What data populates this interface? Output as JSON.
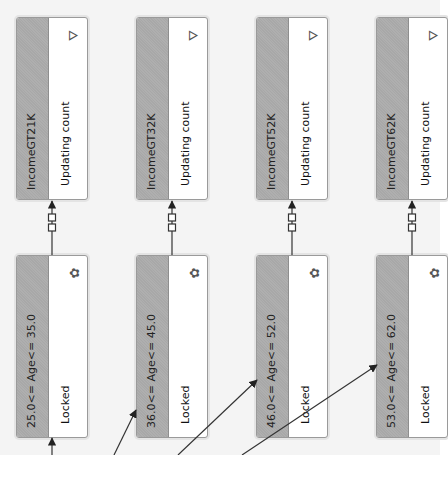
{
  "diagram": {
    "orientation": "rotated-90-ccw",
    "colors": {
      "canvas_bg": "#f4f4f4",
      "card_header_band": "#a8a8a8",
      "card_body": "#ffffff",
      "card_border": "#9a9a9a",
      "connector": "#333333"
    },
    "top_row": [
      {
        "title": "IncomeGT21K",
        "status": "Updating count",
        "icon": "sparkle-funnel-icon"
      },
      {
        "title": "IncomeGT32K",
        "status": "Updating count",
        "icon": "sparkle-funnel-icon"
      },
      {
        "title": "IncomeGT52K",
        "status": "Updating count",
        "icon": "sparkle-funnel-icon"
      },
      {
        "title": "IncomeGT62K",
        "status": "Updating count",
        "icon": "sparkle-funnel-icon"
      }
    ],
    "bottom_row": [
      {
        "title": "25.0<= Age<= 35.0",
        "status": "Locked",
        "icon": "cluster-node-icon"
      },
      {
        "title": "36.0<= Age<= 45.0",
        "status": "Locked",
        "icon": "cluster-node-icon"
      },
      {
        "title": "46.0<= Age<= 52.0",
        "status": "Locked",
        "icon": "cluster-node-icon"
      },
      {
        "title": "53.0<= Age<= 62.0",
        "status": "Locked",
        "icon": "cluster-node-icon"
      }
    ],
    "connections": [
      {
        "from": "25.0<= Age<= 35.0",
        "to": "IncomeGT21K"
      },
      {
        "from": "36.0<= Age<= 45.0",
        "to": "IncomeGT32K"
      },
      {
        "from": "46.0<= Age<= 52.0",
        "to": "IncomeGT52K"
      },
      {
        "from": "53.0<= Age<= 62.0",
        "to": "IncomeGT62K"
      }
    ]
  }
}
